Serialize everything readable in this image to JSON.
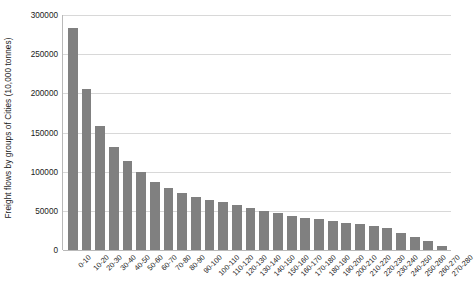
{
  "chart_data": {
    "type": "bar",
    "title": "",
    "subtitle": "",
    "xlabel": "",
    "ylabel": "Freight flows by groups of Cities (10,000 tonnes)",
    "ylim": [
      0,
      300000
    ],
    "ytick_labels": [
      "0",
      "50000",
      "100000",
      "150000",
      "200000",
      "250000",
      "300000"
    ],
    "ytick_values": [
      0,
      50000,
      100000,
      150000,
      200000,
      250000,
      300000
    ],
    "grid": true,
    "legend": null,
    "legend_position": "none",
    "bar_color": "#808080",
    "gridline_color": "#d8d8d8",
    "axis_color": "#b9b9b9",
    "categories": [
      "0-10",
      "10-20",
      "20-30",
      "30-40",
      "40-50",
      "50-60",
      "60-70",
      "70-80",
      "80-90",
      "90-100",
      "100-110",
      "110-120",
      "120-130",
      "130-140",
      "140-150",
      "150-160",
      "160-170",
      "170-180",
      "180-190",
      "190-200",
      "200-210",
      "210-220",
      "220-230",
      "230-240",
      "240-250",
      "250-260",
      "260-270",
      "270-280"
    ],
    "values": [
      284000,
      206000,
      158000,
      131000,
      113000,
      99000,
      87000,
      79000,
      73000,
      68000,
      64000,
      61000,
      58000,
      54000,
      50000,
      47000,
      44000,
      41000,
      39000,
      37000,
      35000,
      33000,
      31000,
      28000,
      22000,
      17000,
      12000,
      5000
    ]
  }
}
